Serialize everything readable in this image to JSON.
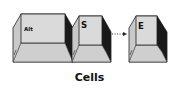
{
  "diagram": {
    "keys": [
      {
        "id": "alt",
        "label": "Alt"
      },
      {
        "id": "s",
        "label": "S"
      },
      {
        "id": "e",
        "label": "E"
      }
    ],
    "connector": "dotted-arrow",
    "caption": "Cells"
  },
  "colors": {
    "key_face": "#d9d9d9",
    "key_side": "#c4c4c4",
    "key_shadow": "#1a1a1a",
    "outline": "#222222"
  }
}
